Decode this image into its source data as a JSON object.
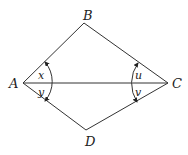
{
  "diagram": {
    "type": "quadrilateral-with-diagonal",
    "vertices": {
      "A": {
        "label": "A",
        "x": 23,
        "y": 83
      },
      "B": {
        "label": "B",
        "x": 84,
        "y": 23
      },
      "C": {
        "label": "C",
        "x": 168,
        "y": 83
      },
      "D": {
        "label": "D",
        "x": 86,
        "y": 130
      }
    },
    "edges": [
      "AB",
      "BC",
      "CD",
      "DA",
      "AC"
    ],
    "angles": {
      "x": {
        "label": "x",
        "vertex": "A",
        "between": "AB-AC"
      },
      "y": {
        "label": "y",
        "vertex": "A",
        "between": "AC-AD"
      },
      "u": {
        "label": "u",
        "vertex": "C",
        "between": "CB-CA"
      },
      "v": {
        "label": "v",
        "vertex": "C",
        "between": "CA-CD"
      }
    }
  }
}
